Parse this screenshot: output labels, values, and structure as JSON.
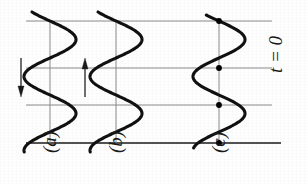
{
  "figure": {
    "caption_labels": [
      {
        "id": "a",
        "text": "(a)",
        "x": 50
      },
      {
        "id": "b",
        "text": "(b)",
        "x": 116
      },
      {
        "id": "c",
        "text": "(c)",
        "x": 219
      }
    ],
    "time_annotation": {
      "text": "t = 0",
      "x": 284,
      "y": 84
    },
    "arrows": [
      {
        "name": "down-arrow",
        "direction": "down",
        "x": 21,
        "y_start": 58,
        "y_end": 97
      },
      {
        "name": "up-arrow",
        "direction": "up",
        "x": 85,
        "y_start": 97,
        "y_end": 58
      }
    ]
  },
  "chart_data": {
    "type": "line",
    "title": "",
    "subtitle": "",
    "xlabel": "",
    "ylabel": "",
    "orientation": "vertical-waves",
    "grid": true,
    "legend_position": "none",
    "axis_lines_x": [
      50,
      116,
      219
    ],
    "axis_lines_y_range": [
      21,
      143
    ],
    "gridlines_y": [
      21,
      68,
      105,
      143
    ],
    "gridline_x_start": 26,
    "gridline_x_end": 272,
    "bottom_line_x_end": 281,
    "bottom_line_emphasis": true,
    "amplitude_px": 26,
    "wavelength_px": 74,
    "series": [
      {
        "name": "(a)",
        "axis_x": 50,
        "phase_deg": 0,
        "y_top": 12,
        "y_bottom": 152,
        "marked_points": []
      },
      {
        "name": "(b)",
        "axis_x": 116,
        "phase_deg": 0,
        "y_top": 12,
        "y_bottom": 152,
        "marked_points": []
      },
      {
        "name": "(c)",
        "axis_x": 219,
        "phase_deg": 0,
        "y_top": 15,
        "y_bottom": 148,
        "marked_points": [
          {
            "x": 219,
            "y": 21
          },
          {
            "x": 219,
            "y": 68
          },
          {
            "x": 219,
            "y": 105
          },
          {
            "x": 219,
            "y": 143
          }
        ]
      }
    ],
    "colors": {
      "curve": "#111111",
      "gridline": "#8a8a8a",
      "axis_line": "#8a8a8a",
      "bottom_line": "#1a1a1a",
      "marker": "#000000",
      "arrow": "#1a1a1a",
      "background": "#fefefe"
    }
  }
}
